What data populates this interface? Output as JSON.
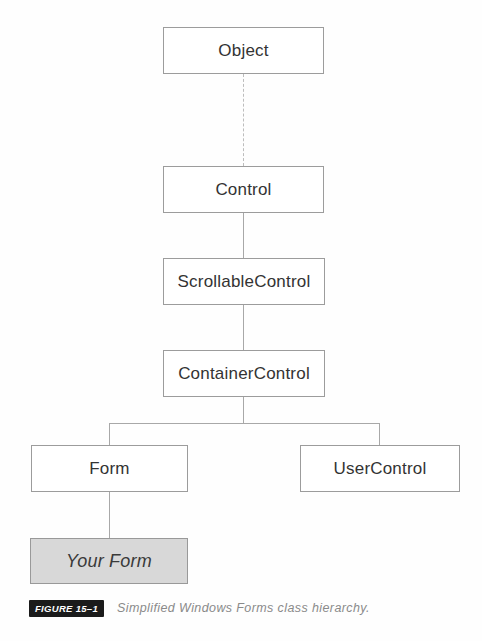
{
  "diagram": {
    "title_context": "Simplified Windows Forms class hierarchy",
    "nodes": [
      {
        "id": "object",
        "label": "Object",
        "highlighted": false
      },
      {
        "id": "control",
        "label": "Control",
        "highlighted": false
      },
      {
        "id": "scrollablecontrol",
        "label": "ScrollableControl",
        "highlighted": false
      },
      {
        "id": "containercontrol",
        "label": "ContainerControl",
        "highlighted": false
      },
      {
        "id": "form",
        "label": "Form",
        "highlighted": false
      },
      {
        "id": "usercontrol",
        "label": "UserControl",
        "highlighted": false
      },
      {
        "id": "yourform",
        "label": "Your Form",
        "highlighted": true
      }
    ],
    "edges": [
      {
        "from": "object",
        "to": "control",
        "style": "dotted"
      },
      {
        "from": "control",
        "to": "scrollablecontrol",
        "style": "solid"
      },
      {
        "from": "scrollablecontrol",
        "to": "containercontrol",
        "style": "solid"
      },
      {
        "from": "containercontrol",
        "to": "form",
        "style": "solid"
      },
      {
        "from": "containercontrol",
        "to": "usercontrol",
        "style": "solid"
      },
      {
        "from": "form",
        "to": "yourform",
        "style": "solid"
      }
    ],
    "colors": {
      "node_border": "#9c9c9c",
      "node_fill": "#ffffff",
      "highlight_fill": "#d8d8d8",
      "edge": "#a8a8a8",
      "text": "#333333",
      "figure_tag_bg": "#1b1b1b",
      "figure_tag_text": "#ffffff",
      "caption_text": "#8a8a8a"
    }
  },
  "figure": {
    "tag": "FIGURE 15–1",
    "caption": "Simplified Windows Forms class hierarchy."
  }
}
